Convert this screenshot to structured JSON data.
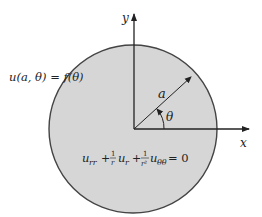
{
  "diagram": {
    "type": "disk-laplace-dirichlet",
    "colors": {
      "disk_fill": "#d6d6d6",
      "disk_stroke": "#444444",
      "axis": "#222222",
      "text": "#222222",
      "background": "#ffffff"
    },
    "axes": {
      "x_label": "x",
      "y_label": "y"
    },
    "labels": {
      "boundary_condition": "u(a, θ) = f(θ)",
      "radius": "a",
      "angle": "θ",
      "pde": {
        "term1_base": "u",
        "term1_sub": "rr",
        "plus1": "+",
        "frac1_num": "1",
        "frac1_den": "r",
        "term2_base": "u",
        "term2_sub": "r",
        "plus2": "+",
        "frac2_num": "1",
        "frac2_den": "r²",
        "term3_base": "u",
        "term3_sub": "θθ",
        "equals": "= 0"
      }
    }
  }
}
